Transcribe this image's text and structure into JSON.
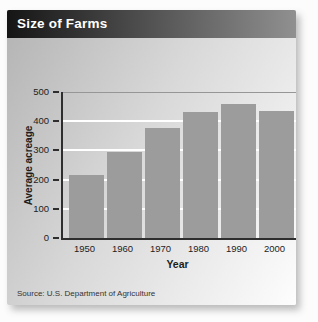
{
  "header": {
    "title": "Size of Farms"
  },
  "footer": {
    "source": "Source: U.S. Department of Agriculture"
  },
  "colors": {
    "header_gradient_left": "#151515",
    "header_gradient_right": "#909090",
    "body_gradient_start": "#b3b3b3",
    "body_gradient_mid": "#d8d8d8",
    "body_gradient_end": "#fdfdfd",
    "bar": "#9c9c9c",
    "axis": "#2e2e2e",
    "gridline": "#ffffff",
    "top_gridline": "#969696",
    "title_text": "#ffffff",
    "label_text": "#1d1d1d"
  },
  "chart_data": {
    "type": "bar",
    "title": "Size of Farms",
    "categories": [
      "1950",
      "1960",
      "1970",
      "1980",
      "1990",
      "2000"
    ],
    "values": [
      215,
      295,
      375,
      430,
      460,
      435
    ],
    "xlabel": "Year",
    "ylabel": "Average acreage",
    "ylim": [
      0,
      500
    ],
    "yticks": [
      0,
      100,
      200,
      300,
      400,
      500
    ],
    "grid": true,
    "legend": false
  }
}
